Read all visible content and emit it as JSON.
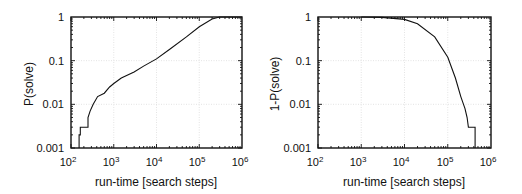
{
  "chart_data": [
    {
      "type": "line",
      "title": "",
      "xlabel": "run-time [search steps]",
      "ylabel": "P(solve)",
      "xscale": "log",
      "yscale": "log",
      "xlim": [
        100,
        1000000
      ],
      "ylim": [
        0.001,
        1
      ],
      "grid": true,
      "legend": null,
      "x_ticks": [
        "10^2",
        "10^3",
        "10^4",
        "10^5",
        "10^6"
      ],
      "y_ticks": [
        "0.001",
        "0.01",
        "0.1",
        "1"
      ],
      "series": [
        {
          "name": "P(solve)",
          "x": [
            155,
            155,
            165,
            165,
            250,
            250,
            280,
            330,
            420,
            600,
            800,
            1000,
            1500,
            3000,
            5000,
            10000,
            20000,
            50000,
            100000,
            200000,
            300000,
            1000000
          ],
          "y": [
            0.001,
            0.002,
            0.002,
            0.003,
            0.003,
            0.005,
            0.007,
            0.01,
            0.015,
            0.018,
            0.025,
            0.03,
            0.04,
            0.055,
            0.075,
            0.11,
            0.18,
            0.35,
            0.6,
            0.9,
            1.0,
            1.0
          ]
        }
      ]
    },
    {
      "type": "line",
      "title": "",
      "xlabel": "run-time [search steps]",
      "ylabel": "1-P(solve)",
      "xscale": "log",
      "yscale": "log",
      "xlim": [
        100,
        1000000
      ],
      "ylim": [
        0.001,
        1
      ],
      "grid": true,
      "legend": null,
      "x_ticks": [
        "10^2",
        "10^3",
        "10^4",
        "10^5",
        "10^6"
      ],
      "y_ticks": [
        "0.001",
        "0.01",
        "0.1",
        "1"
      ],
      "series": [
        {
          "name": "1-P(solve)",
          "x": [
            1000,
            3000,
            10000,
            20000,
            50000,
            100000,
            150000,
            200000,
            250000,
            280000,
            300000,
            400000,
            430000,
            430000
          ],
          "y": [
            1.0,
            0.98,
            0.88,
            0.7,
            0.35,
            0.12,
            0.04,
            0.015,
            0.008,
            0.005,
            0.003,
            0.003,
            0.003,
            0.001
          ]
        }
      ]
    }
  ],
  "charts": {
    "left": {
      "ylabel": "P(solve)",
      "xlabel": "run-time [search steps]",
      "y_tick_labels": [
        "1",
        "0.1",
        "0.01",
        "0.001"
      ],
      "x_tick_bases": [
        "10",
        "10",
        "10",
        "10",
        "10"
      ],
      "x_tick_exps": [
        "2",
        "3",
        "4",
        "5",
        "6"
      ]
    },
    "right": {
      "ylabel": "1-P(solve)",
      "xlabel": "run-time [search steps]",
      "y_tick_labels": [
        "1",
        "0.1",
        "0.01",
        "0.001"
      ],
      "x_tick_bases": [
        "10",
        "10",
        "10",
        "10",
        "10"
      ],
      "x_tick_exps": [
        "2",
        "3",
        "4",
        "5",
        "6"
      ]
    }
  }
}
